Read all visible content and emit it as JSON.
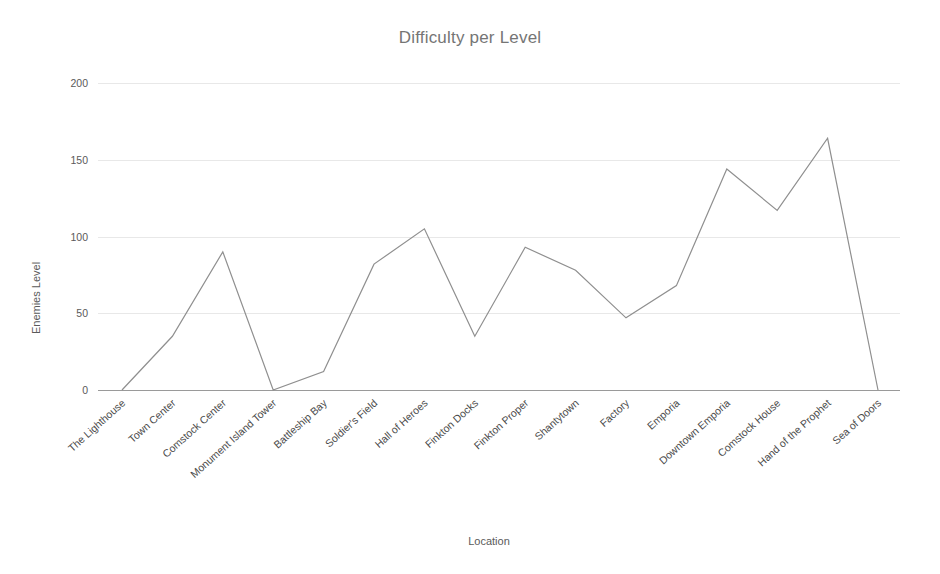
{
  "chart_data": {
    "type": "line",
    "title": "Difficulty per Level",
    "xlabel": "Location",
    "ylabel": "Enemies Level",
    "ylim": [
      0,
      200
    ],
    "yticks": [
      0,
      50,
      100,
      150,
      200
    ],
    "grid": true,
    "legend": null,
    "line_color": "#8f8f8f",
    "categories": [
      "The Lighthouse",
      "Town Center",
      "Comstock Center",
      "Monument Island Tower",
      "Battleship Bay",
      "Soldier's Field",
      "Hall of Heroes",
      "Finkton Docks",
      "Finkton Proper",
      "Shantytown",
      "Factory",
      "Emporia",
      "Downtown Emporia",
      "Comstock House",
      "Hand of the Prophet",
      "Sea of Doors"
    ],
    "values": [
      0,
      35,
      90,
      0,
      12,
      82,
      105,
      35,
      93,
      78,
      47,
      68,
      144,
      117,
      164,
      0
    ],
    "series": [
      {
        "name": "Enemies Level",
        "values": [
          0,
          35,
          90,
          0,
          12,
          82,
          105,
          35,
          93,
          78,
          47,
          68,
          144,
          117,
          164,
          0
        ]
      }
    ]
  }
}
